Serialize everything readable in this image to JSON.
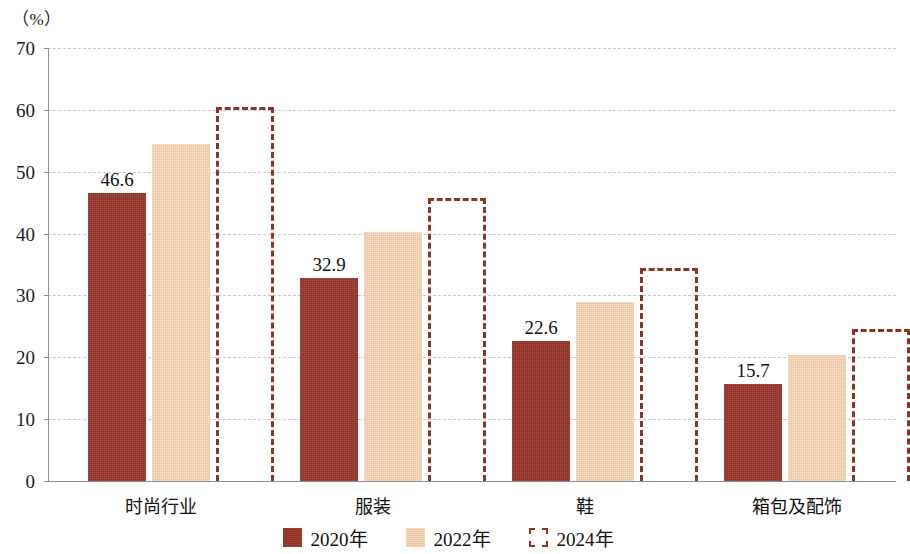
{
  "chart_data": {
    "type": "bar",
    "title": "",
    "subtitle": "",
    "xlabel": "",
    "ylabel": "（%）",
    "ylim": [
      0,
      70
    ],
    "ytick_step": 10,
    "yticks": [
      70,
      60,
      50,
      40,
      30,
      20,
      10,
      0
    ],
    "grid": true,
    "legend_position": "bottom-center",
    "categories": [
      "时尚行业",
      "服装",
      "鞋",
      "箱包及配饰"
    ],
    "series": [
      {
        "name": "2020年",
        "style": "filled-dark",
        "color": "#963327",
        "values": [
          46.6,
          32.9,
          22.6,
          15.7
        ],
        "labels": [
          "46.6",
          "32.9",
          "22.6",
          "15.7"
        ],
        "labels_shown": true
      },
      {
        "name": "2022年",
        "style": "filled-light",
        "color": "#f3cdab",
        "values": [
          54.5,
          40.2,
          28.9,
          20.4
        ],
        "labels": [
          "",
          "",
          "",
          ""
        ],
        "labels_shown": false
      },
      {
        "name": "2024年",
        "style": "dashed-outline",
        "color": "#8c3524",
        "values": [
          60.5,
          45.8,
          34.4,
          24.5
        ],
        "labels": [
          "",
          "",
          "",
          ""
        ],
        "labels_shown": false
      }
    ]
  },
  "axis": {
    "unit_label": "（%）",
    "tick_0": "0",
    "tick_10": "10",
    "tick_20": "20",
    "tick_30": "30",
    "tick_40": "40",
    "tick_50": "50",
    "tick_60": "60",
    "tick_70": "70"
  },
  "categories": {
    "c0": "时尚行业",
    "c1": "服装",
    "c2": "鞋",
    "c3": "箱包及配饰"
  },
  "legend": {
    "item0": "2020年",
    "item1": "2022年",
    "item2": "2024年"
  },
  "bar_labels": {
    "g0": "46.6",
    "g1": "32.9",
    "g2": "22.6",
    "g3": "15.7"
  },
  "colors": {
    "series_2020": "#963327",
    "series_2022": "#f3cdab",
    "series_2024_outline": "#8c3524",
    "gridline": "#c3c9cf",
    "axis": "#8d8d8d"
  }
}
